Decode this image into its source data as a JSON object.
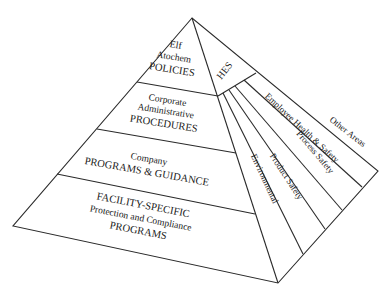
{
  "diagram": {
    "type": "pyramid",
    "left_face_tiers": [
      {
        "lines": [
          "Elf",
          "Atochem",
          "POLICIES"
        ]
      },
      {
        "lines": [
          "Corporate",
          "Administrative",
          "PROCEDURES"
        ]
      },
      {
        "lines": [
          "Company",
          "PROGRAMS & GUIDANCE"
        ]
      },
      {
        "lines": [
          "FACILITY-SPECIFIC",
          "Protection and Compliance",
          "PROGRAMS"
        ]
      }
    ],
    "right_face": {
      "top_label": "HES",
      "sectors": [
        "Environmental",
        "Product Safety",
        "Process Safety",
        "Employee Health & Safety",
        "Other Areas"
      ]
    },
    "colors": {
      "line": "#2a2a2a",
      "text": "#1a1a1a",
      "background": "#ffffff"
    }
  }
}
